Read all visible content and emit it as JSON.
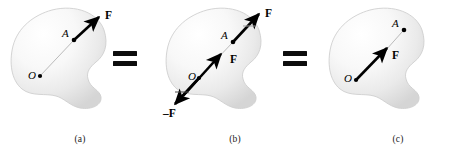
{
  "figure": {
    "background_color": "#ffffff",
    "ink_color": "#000000",
    "body_fill_light": "#fdfdfd",
    "body_fill_dark": "#d8d8d8",
    "body_edge_color": "#c9c9c9",
    "construction_line_color": "#a8a8a8"
  },
  "equals_signs": [
    {
      "name": "equals-between-a-and-b",
      "symbol": "="
    },
    {
      "name": "equals-between-b-and-c",
      "symbol": "="
    }
  ],
  "panels": [
    {
      "id": "a",
      "caption": "(a)",
      "labels": {
        "origin": "O",
        "application_point": "A",
        "force": "F"
      },
      "forces": [
        {
          "name": "F",
          "label": "F",
          "applied_at": "A",
          "direction": "up-right"
        }
      ]
    },
    {
      "id": "b",
      "caption": "(b)",
      "labels": {
        "origin": "O",
        "application_point": "A",
        "force": "F",
        "force_upper": "F",
        "force_negative": "–F"
      },
      "forces": [
        {
          "name": "F-upper",
          "label": "F",
          "applied_at": "A",
          "direction": "up-right"
        },
        {
          "name": "F-lower",
          "label": "F",
          "applied_at": "O",
          "direction": "up-right"
        },
        {
          "name": "minus-F",
          "label": "–F",
          "applied_at": "O",
          "direction": "down-left"
        }
      ]
    },
    {
      "id": "c",
      "caption": "(c)",
      "labels": {
        "origin": "O",
        "application_point": "A",
        "force": "F"
      },
      "forces": [
        {
          "name": "F",
          "label": "F",
          "applied_at": "O",
          "direction": "up-right"
        }
      ]
    }
  ]
}
